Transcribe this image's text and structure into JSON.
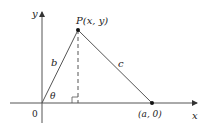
{
  "diagram": {
    "axis_x_label": "x",
    "axis_y_label": "y",
    "origin_label": "0",
    "point_p_label": "P(x, y)",
    "point_a_label": "(a, 0)",
    "side_b_label": "b",
    "side_c_label": "c",
    "angle_label": "θ",
    "colors": {
      "line": "#555555",
      "text": "#222222"
    }
  }
}
